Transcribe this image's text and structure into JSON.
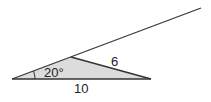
{
  "diagram": {
    "type": "triangle-with-extended-side",
    "angle_label": "20°",
    "side_labels": {
      "slanted_side": "6",
      "base": "10"
    },
    "colors": {
      "fill": "#d9d9d9",
      "stroke": "#333333",
      "text": "#222222"
    }
  }
}
